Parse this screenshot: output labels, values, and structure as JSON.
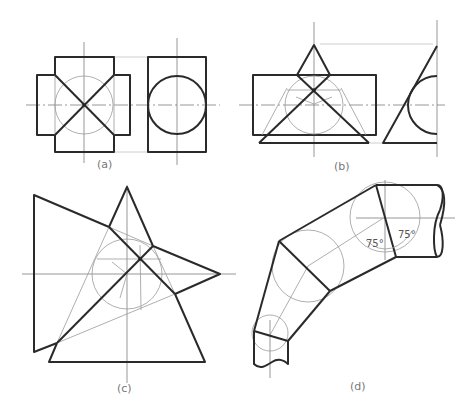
{
  "figure": {
    "panels": [
      {
        "id": "a",
        "label": "(a)"
      },
      {
        "id": "b",
        "label": "(b)"
      },
      {
        "id": "c",
        "label": "(c)"
      },
      {
        "id": "d",
        "label": "(d)"
      }
    ],
    "annotations": {
      "angle_left": "75°",
      "angle_right": "75°"
    }
  }
}
